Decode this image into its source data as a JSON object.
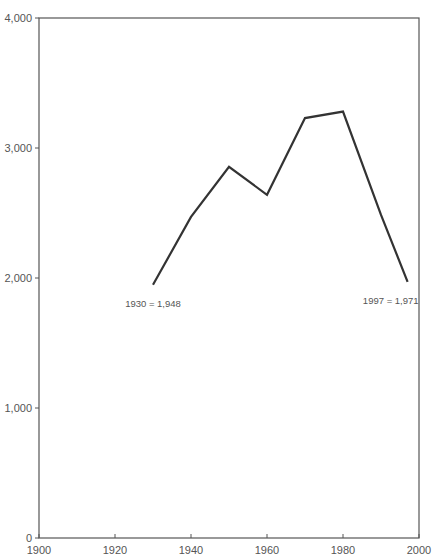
{
  "chart_data": {
    "type": "line",
    "title": "",
    "xlabel": "",
    "ylabel": "",
    "xlim": [
      1900,
      2000
    ],
    "ylim": [
      0,
      4000
    ],
    "x_ticks": [
      1900,
      1920,
      1940,
      1960,
      1980,
      2000
    ],
    "x_tick_labels": [
      "1900",
      "1920",
      "1940",
      "1960",
      "1980",
      "2000"
    ],
    "y_ticks": [
      0,
      1000,
      2000,
      3000,
      4000
    ],
    "y_tick_labels": [
      "0",
      "1,000",
      "2,000",
      "3,000",
      "4,000"
    ],
    "grid": false,
    "legend": null,
    "series": [
      {
        "name": "Population",
        "color": "#333333",
        "x": [
          1930,
          1940,
          1950,
          1960,
          1970,
          1980,
          1990,
          1997
        ],
        "values": [
          1948,
          2470,
          2855,
          2640,
          3230,
          3280,
          2485,
          1971
        ]
      }
    ],
    "annotations": [
      {
        "text": "1930 = 1,948",
        "x": 1930,
        "y": 1948
      },
      {
        "text": "1997 = 1,971",
        "x": 1997,
        "y": 1971
      }
    ]
  }
}
